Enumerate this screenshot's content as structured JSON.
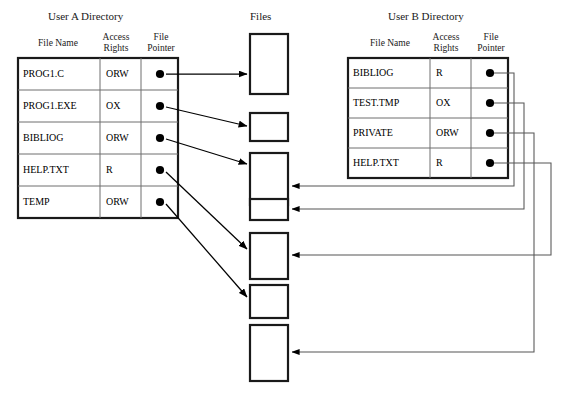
{
  "diagram": {
    "title_user_a": "User A Directory",
    "title_files": "Files",
    "title_user_b": "User B Directory",
    "column_headers": {
      "file_name": "File Name",
      "access_rights_l1": "Access",
      "access_rights_l2": "Rights",
      "file_pointer_l1": "File",
      "file_pointer_l2": "Pointer"
    },
    "colors": {
      "line": "#000000",
      "thin_line": "#555555",
      "table_border": "#1a1a1a",
      "row_rule": "#6e6e6e",
      "background": "#ffffff"
    },
    "user_a_directory": {
      "rows": [
        {
          "file_name": "PROG1.C",
          "access_rights": "ORW",
          "file_pointer": "dot",
          "target_file_index": 1
        },
        {
          "file_name": "PROG1.EXE",
          "access_rights": "OX",
          "file_pointer": "dot",
          "target_file_index": 2
        },
        {
          "file_name": "BIBLIOG",
          "access_rights": "ORW",
          "file_pointer": "dot",
          "target_file_index": 3
        },
        {
          "file_name": "HELP.TXT",
          "access_rights": "R",
          "file_pointer": "dot",
          "target_file_index": 5
        },
        {
          "file_name": "TEMP",
          "access_rights": "ORW",
          "file_pointer": "dot",
          "target_file_index": 6
        }
      ]
    },
    "user_b_directory": {
      "rows": [
        {
          "file_name": "BIBLIOG",
          "access_rights": "R",
          "file_pointer": "dot",
          "target_file_index": 3
        },
        {
          "file_name": "TEST.TMP",
          "access_rights": "OX",
          "file_pointer": "dot",
          "target_file_index": 4
        },
        {
          "file_name": "PRIVATE",
          "access_rights": "ORW",
          "file_pointer": "dot",
          "target_file_index": 7
        },
        {
          "file_name": "HELP.TXT",
          "access_rights": "R",
          "file_pointer": "dot",
          "target_file_index": 5
        }
      ]
    },
    "files": [
      {
        "index": 1,
        "label": ""
      },
      {
        "index": 2,
        "label": ""
      },
      {
        "index": 3,
        "label": ""
      },
      {
        "index": 4,
        "label": ""
      },
      {
        "index": 5,
        "label": ""
      },
      {
        "index": 6,
        "label": ""
      },
      {
        "index": 7,
        "label": ""
      }
    ]
  }
}
